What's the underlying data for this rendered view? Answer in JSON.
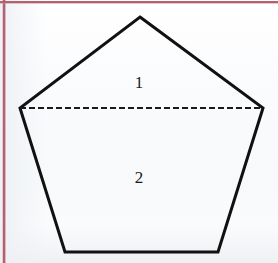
{
  "figure": {
    "background_color": "#fbfcfd",
    "paper": {
      "margin_line_color": "#b4606f",
      "margin_line_vertical_x": 4,
      "margin_line_horizontal_y": 2
    },
    "shape": {
      "name": "pentagon",
      "stroke_color": "#111111",
      "stroke_width": 3,
      "fill_color": "none",
      "vertices": [
        {
          "name": "apex-top",
          "x": 140,
          "y": 17
        },
        {
          "name": "upper-right",
          "x": 263,
          "y": 108
        },
        {
          "name": "lower-right",
          "x": 218,
          "y": 252
        },
        {
          "name": "lower-left",
          "x": 65,
          "y": 252
        },
        {
          "name": "upper-left",
          "x": 20,
          "y": 108
        }
      ],
      "points_attr": "140,17 263,108 218,252 65,252 20,108"
    },
    "divider": {
      "name": "dashed-chord",
      "stroke_color": "#1a1a1a",
      "stroke_width": 2,
      "dash_pattern": "6,3",
      "x1": 20,
      "y1": 108,
      "x2": 263,
      "y2": 108
    },
    "labels": [
      {
        "name": "region-label-1",
        "text": "1",
        "x": 139,
        "y": 82
      },
      {
        "name": "region-label-2",
        "text": "2",
        "x": 139,
        "y": 177
      }
    ]
  }
}
